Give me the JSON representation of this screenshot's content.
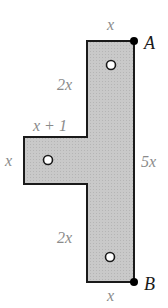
{
  "diagram": {
    "shape": {
      "fill": "#c9c9c9",
      "stroke": "#1a1a1a",
      "points": [
        [
          87,
          41
        ],
        [
          134,
          41
        ],
        [
          134,
          282
        ],
        [
          87,
          282
        ],
        [
          87,
          184
        ],
        [
          24,
          184
        ],
        [
          24,
          137
        ],
        [
          87,
          137
        ]
      ]
    },
    "labels": {
      "top_width": "x",
      "upper_left_height": "2x",
      "arm_width": "x + 1",
      "arm_height": "x",
      "right_height": "5x",
      "lower_left_height": "2x",
      "bottom_width": "x"
    },
    "points": {
      "A": "A",
      "B": "B"
    },
    "holes": [
      {
        "cx": 111,
        "cy": 65
      },
      {
        "cx": 48,
        "cy": 160
      },
      {
        "cx": 110,
        "cy": 257
      }
    ]
  }
}
